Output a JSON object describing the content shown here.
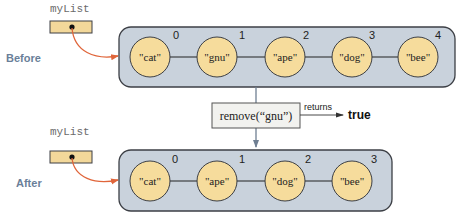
{
  "colors": {
    "list_bg": "#c9d2dc",
    "list_border": "#3c3f45",
    "node_fill": "#f6dc9c",
    "node_border": "#3c3f45",
    "ref_box_fill": "#f3d89a",
    "pointer_arrow": "#e0653a",
    "state_label": "#6a7f99",
    "call_box_fill": "#f2f2ef"
  },
  "before": {
    "state_label": "Before",
    "variable": "myList",
    "nodes": [
      {
        "value": "\"cat\"",
        "index": "0"
      },
      {
        "value": "\"gnu\"",
        "index": "1"
      },
      {
        "value": "\"ape\"",
        "index": "2"
      },
      {
        "value": "\"dog\"",
        "index": "3"
      },
      {
        "value": "\"bee\"",
        "index": "4"
      }
    ]
  },
  "operation": {
    "call": "remove(“gnu”)",
    "returns_label": "returns",
    "return_value": "true"
  },
  "after": {
    "state_label": "After",
    "variable": "myList",
    "nodes": [
      {
        "value": "\"cat\"",
        "index": "0"
      },
      {
        "value": "\"ape\"",
        "index": "1"
      },
      {
        "value": "\"dog\"",
        "index": "2"
      },
      {
        "value": "\"bee\"",
        "index": "3"
      }
    ]
  }
}
